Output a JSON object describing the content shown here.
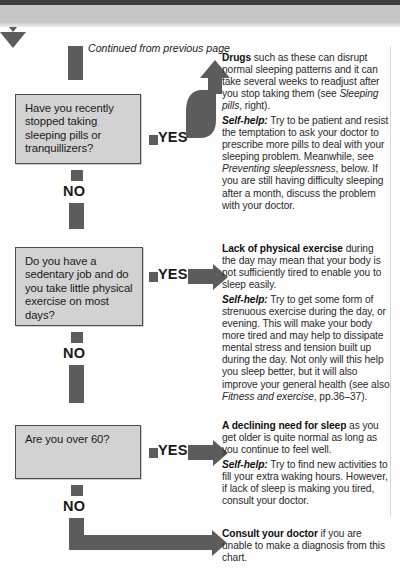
{
  "page": {
    "kind": "medical-symptom-flowchart",
    "continued_note": "Continued from previous page",
    "yes_label": "YES",
    "no_label": "NO"
  },
  "nodes": [
    {
      "id": "q1",
      "question": "Have you recently stopped taking sleeping pills or tranquillizers?",
      "yes_label": "YES",
      "no_label": "NO"
    },
    {
      "id": "q2",
      "question": "Do you have a sedentary job and do you take little physical exercise on most days?",
      "yes_label": "YES",
      "no_label": "NO"
    },
    {
      "id": "q3",
      "question": "Are you over 60?",
      "yes_label": "YES",
      "no_label": "NO"
    }
  ],
  "answers": [
    {
      "id": "a1",
      "lead": "Drugs",
      "body": " such as these can disrupt normal sleeping patterns and it can take several weeks to readjust after you stop taking them (see ",
      "body_italic": "Sleeping pills",
      "body_tail": ", right).",
      "selfhelp_label": "Self-help:",
      "selfhelp_1": " Try to be patient and resist the temptation to ask your doctor to prescribe more pills to deal with your sleeping problem. Meanwhile, see ",
      "selfhelp_italic": "Preventing sleeplessness",
      "selfhelp_2": ", below. If you are still having difficulty sleeping after a month, discuss the problem with your doctor."
    },
    {
      "id": "a2",
      "lead": "Lack of physical exercise",
      "body": " during the day may mean that your body is not sufficiently tired to enable you to sleep easily.",
      "selfhelp_label": "Self-help:",
      "selfhelp_1": " Try to get some form of strenuous exercise during the day, or evening. This will make your body more tired and may help to dissipate mental stress and tension built up during the day. Not only will this help you sleep better, but it will also improve your general health (see also ",
      "selfhelp_italic": "Fitness and exercise",
      "selfhelp_2": ", pp.36–37)."
    },
    {
      "id": "a3",
      "lead": "A declining need for sleep",
      "body": " as you get older is quite normal as long as you continue to feel well.",
      "selfhelp_label": "Self-help:",
      "selfhelp_1": " Try to find new activities to fill your extra waking hours. However, if lack of sleep is making you tired, consult your doctor."
    },
    {
      "id": "a4",
      "lead": "Consult your doctor",
      "body": " if you are unable to make a diagnosis from this chart."
    }
  ],
  "colors": {
    "arrow_ink": "#5c5c5c",
    "box_fill": "#d2d2d2",
    "box_border": "#4d4d4d",
    "header_dark": "#3e3e41",
    "header_gray": "#c6c6c6"
  }
}
